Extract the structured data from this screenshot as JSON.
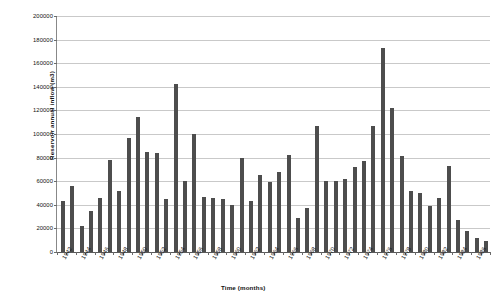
{
  "chart_data": {
    "type": "bar",
    "title": "",
    "xlabel": "Time (months)",
    "ylabel": "Reservoir annual inflow (m3)",
    "ylim": [
      0,
      200000
    ],
    "ytick_step": 20000,
    "yticks": [
      0,
      20000,
      40000,
      60000,
      80000,
      100000,
      120000,
      140000,
      160000,
      180000,
      200000
    ],
    "ytick_labels": [
      "0",
      "20000",
      "40000",
      "60000",
      "80000",
      "100000",
      "120000",
      "140000",
      "160000",
      "180000",
      "200000"
    ],
    "grid": true,
    "legend": false,
    "bar_color": "#4d4d4d",
    "xtick_labels": [
      "1942",
      "1944",
      "1946",
      "1948",
      "1950",
      "1952",
      "1954",
      "1956",
      "1958",
      "1960",
      "1962",
      "1964",
      "1966",
      "1968",
      "1970",
      "1972",
      "1974",
      "1976",
      "1978",
      "1980",
      "1982",
      "1984",
      "1986"
    ],
    "xtick_every": 2,
    "categories": [
      "1942",
      "1943",
      "1944",
      "1945",
      "1946",
      "1947",
      "1948",
      "1949",
      "1950",
      "1951",
      "1952",
      "1953",
      "1954",
      "1955",
      "1956",
      "1957",
      "1958",
      "1959",
      "1960",
      "1961",
      "1962",
      "1963",
      "1964",
      "1965",
      "1966",
      "1967",
      "1968",
      "1969",
      "1970",
      "1971",
      "1972",
      "1973",
      "1974",
      "1975",
      "1976",
      "1977",
      "1978",
      "1979",
      "1980",
      "1981",
      "1982",
      "1983",
      "1984",
      "1985",
      "1986",
      "1987"
    ],
    "values": [
      43000,
      56000,
      22000,
      35000,
      46000,
      78000,
      52000,
      97000,
      114000,
      85000,
      84000,
      45000,
      142000,
      60000,
      100000,
      47000,
      46000,
      45000,
      40000,
      80000,
      43000,
      65000,
      59000,
      68000,
      82000,
      29000,
      37000,
      107000,
      60000,
      60000,
      62000,
      72000,
      77000,
      107000,
      173000,
      122000,
      81000,
      52000,
      50000,
      39000,
      46000,
      73000,
      27000,
      18000,
      12000,
      9000
    ],
    "extra_values": [
      33000,
      50000,
      8000
    ]
  }
}
